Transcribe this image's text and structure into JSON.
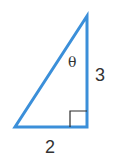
{
  "diagram": {
    "type": "right-triangle",
    "angle_label": "θ",
    "opposite_side_label": "3",
    "adjacent_side_label": "2",
    "colors": {
      "triangle_stroke": "#3b8fd9",
      "right_angle_marker": "#2b2b2b",
      "label_text": "#333333"
    }
  }
}
